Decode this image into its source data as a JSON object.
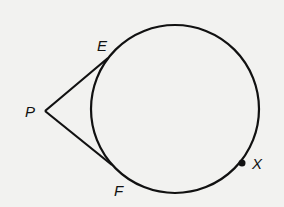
{
  "diagram": {
    "circle": {
      "cx": 175,
      "cy": 109,
      "r": 84
    },
    "points": {
      "P": {
        "label": "P",
        "x": 45,
        "y": 111
      },
      "E": {
        "label": "E",
        "x": 108,
        "y": 58
      },
      "F": {
        "label": "F",
        "x": 112,
        "y": 165
      },
      "X": {
        "label": "X",
        "x": 242,
        "y": 163
      }
    },
    "segments": [
      [
        "P",
        "E"
      ],
      [
        "P",
        "F"
      ]
    ],
    "stroke_color": "#111111",
    "background_color": "#f2f2f0"
  }
}
